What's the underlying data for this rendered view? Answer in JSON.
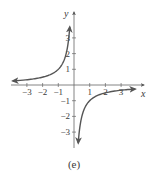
{
  "chart_data": {
    "type": "line",
    "title": "",
    "caption": "(e)",
    "xlabel": "x",
    "ylabel": "y",
    "xlim": [
      -4,
      4
    ],
    "ylim": [
      -4,
      4
    ],
    "x_ticks": [
      -3,
      -2,
      -1,
      1,
      2,
      3
    ],
    "y_ticks": [
      -3,
      -2,
      -1,
      1,
      2,
      3
    ],
    "x_tick_labels": [
      "−3",
      "−2",
      "−1",
      "1",
      "2",
      "3"
    ],
    "y_tick_labels": [
      "−3",
      "−2",
      "−1",
      "1",
      "2",
      "3"
    ],
    "grid": false,
    "legend": null,
    "series": [
      {
        "name": "y = -1/x (x<0 branch)",
        "points": [
          [
            -3.9,
            0.26
          ],
          [
            -3,
            0.33
          ],
          [
            -2,
            0.5
          ],
          [
            -1.5,
            0.67
          ],
          [
            -1,
            1.0
          ],
          [
            -0.75,
            1.33
          ],
          [
            -0.55,
            1.82
          ],
          [
            -0.45,
            2.2
          ],
          [
            -0.38,
            2.6
          ],
          [
            -0.32,
            3.1
          ],
          [
            -0.27,
            3.7
          ]
        ],
        "color": "#555555",
        "arrows": "both"
      },
      {
        "name": "y = -1/x (x>0 branch)",
        "points": [
          [
            0.27,
            -3.7
          ],
          [
            0.32,
            -3.1
          ],
          [
            0.38,
            -2.6
          ],
          [
            0.45,
            -2.2
          ],
          [
            0.55,
            -1.82
          ],
          [
            0.75,
            -1.33
          ],
          [
            1,
            -1.0
          ],
          [
            1.5,
            -0.67
          ],
          [
            2,
            -0.5
          ],
          [
            3,
            -0.33
          ],
          [
            3.9,
            -0.26
          ]
        ],
        "color": "#555555",
        "arrows": "both"
      }
    ]
  }
}
